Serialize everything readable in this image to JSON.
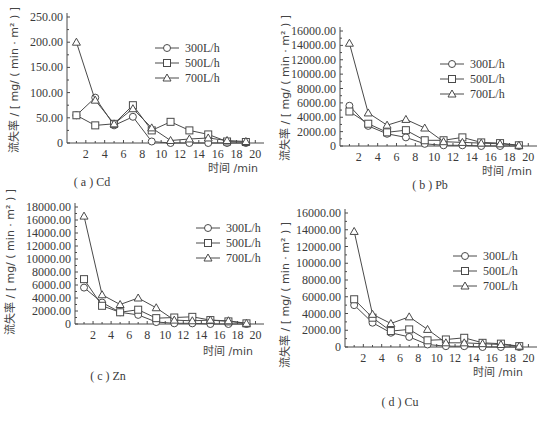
{
  "figure": {
    "y_axis_title": "流失率 / [ mg/ ( min · m² ) ]",
    "x_axis_title": "时间 /min",
    "legend": [
      {
        "label": "300L/h",
        "marker": "diamond-circle"
      },
      {
        "label": "500L/h",
        "marker": "square"
      },
      {
        "label": "700L/h",
        "marker": "triangle"
      }
    ]
  },
  "chart_data": [
    {
      "type": "line",
      "title": "(a) Cd",
      "caption": "( a ) Cd",
      "xlabel": "时间 /min",
      "ylabel": "流失率 / [ mg/ ( min · m² ) ]",
      "x": [
        1,
        3,
        5,
        7,
        9,
        11,
        13,
        15,
        17,
        19
      ],
      "xticks": [
        "2",
        "4",
        "6",
        "8",
        "10",
        "12",
        "14",
        "16",
        "18",
        "20"
      ],
      "yticks": [
        "0",
        "50.00",
        "100.00",
        "150.00",
        "200.00",
        "250.00"
      ],
      "ylim": [
        0,
        250
      ],
      "grid": false,
      "legend_position": "upper right",
      "series": [
        {
          "name": "300L/h",
          "values": [
            55,
            90,
            35,
            52,
            3,
            0,
            0,
            0,
            0,
            0
          ]
        },
        {
          "name": "500L/h",
          "values": [
            55,
            35,
            38,
            75,
            25,
            42,
            25,
            17,
            3,
            2
          ]
        },
        {
          "name": "700L/h",
          "values": [
            200,
            85,
            38,
            68,
            30,
            5,
            8,
            10,
            5,
            3
          ]
        }
      ]
    },
    {
      "type": "line",
      "title": "(b) Pb",
      "caption": "( b ) Pb",
      "xlabel": "时间 /min",
      "ylabel": "流失率 / [ mg/ ( min · m² ) ]",
      "x": [
        1,
        3,
        5,
        7,
        9,
        11,
        13,
        15,
        17,
        19
      ],
      "xticks": [
        "2",
        "4",
        "6",
        "8",
        "10",
        "12",
        "14",
        "16",
        "18",
        "20"
      ],
      "yticks": [
        "0",
        "2000.00",
        "4000.00",
        "6000.00",
        "8000.00",
        "10000.00",
        "12000.00",
        "14000.00",
        "16000.00"
      ],
      "ylim": [
        0,
        16000
      ],
      "grid": false,
      "legend_position": "upper right",
      "series": [
        {
          "name": "300L/h",
          "values": [
            5600,
            2800,
            1700,
            1200,
            300,
            100,
            100,
            0,
            0,
            0
          ]
        },
        {
          "name": "500L/h",
          "values": [
            4800,
            3100,
            1900,
            2200,
            800,
            800,
            1200,
            500,
            400,
            100
          ]
        },
        {
          "name": "700L/h",
          "values": [
            14300,
            4600,
            2900,
            3700,
            2500,
            600,
            500,
            400,
            300,
            100
          ]
        }
      ]
    },
    {
      "type": "line",
      "title": "(c) Zn",
      "caption": "( c ) Zn",
      "xlabel": "时间 /min",
      "ylabel": "流失率 / [ mg/ ( min · m² ) ]",
      "x": [
        1,
        3,
        5,
        7,
        9,
        11,
        13,
        15,
        17,
        19
      ],
      "xticks": [
        "2",
        "4",
        "6",
        "8",
        "10",
        "12",
        "14",
        "16",
        "18",
        "20"
      ],
      "yticks": [
        "0",
        "2000.00",
        "4000.00",
        "6000.00",
        "8000.00",
        "10000.00",
        "12000.00",
        "14000.00",
        "16000.00",
        "18000.00"
      ],
      "ylim": [
        0,
        18000
      ],
      "grid": false,
      "legend_position": "upper right",
      "series": [
        {
          "name": "300L/h",
          "values": [
            5600,
            3300,
            1800,
            1400,
            300,
            100,
            100,
            0,
            0,
            0
          ]
        },
        {
          "name": "500L/h",
          "values": [
            6900,
            2800,
            1800,
            2200,
            900,
            1000,
            1100,
            600,
            400,
            100
          ]
        },
        {
          "name": "700L/h",
          "values": [
            16600,
            4500,
            3000,
            4000,
            2500,
            600,
            500,
            600,
            500,
            100
          ]
        }
      ]
    },
    {
      "type": "line",
      "title": "(d) Cu",
      "caption": "( d ) Cu",
      "xlabel": "时间 /min",
      "ylabel": "流失率 / [ mg/ ( min · m² ) ]",
      "x": [
        1,
        3,
        5,
        7,
        9,
        11,
        13,
        15,
        17,
        19
      ],
      "xticks": [
        "2",
        "4",
        "6",
        "8",
        "10",
        "12",
        "14",
        "16",
        "18",
        "20"
      ],
      "yticks": [
        "0",
        "2000.00",
        "4000.00",
        "6000.00",
        "8000.00",
        "10000.00",
        "12000.00",
        "14000.00",
        "16000.00"
      ],
      "ylim": [
        0,
        16000
      ],
      "grid": false,
      "legend_position": "upper right",
      "series": [
        {
          "name": "300L/h",
          "values": [
            5000,
            2900,
            1700,
            1200,
            300,
            100,
            100,
            0,
            0,
            0
          ]
        },
        {
          "name": "500L/h",
          "values": [
            5700,
            3500,
            1900,
            2100,
            800,
            900,
            1100,
            500,
            400,
            100
          ]
        },
        {
          "name": "700L/h",
          "values": [
            13800,
            3900,
            2800,
            3600,
            2100,
            500,
            500,
            400,
            300,
            100
          ]
        }
      ]
    }
  ]
}
